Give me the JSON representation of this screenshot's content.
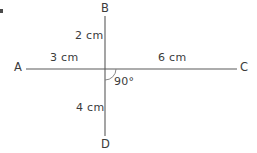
{
  "figure": {
    "background_color": "#ffffff",
    "stroke_color": "#5a5a5a",
    "text_color": "#3b3b3b",
    "vertices": [
      {
        "id": "A",
        "label": "A",
        "x": 14,
        "y": 62
      },
      {
        "id": "B",
        "label": "B",
        "x": 101,
        "y": 3
      },
      {
        "id": "C",
        "label": "C",
        "x": 240,
        "y": 62
      },
      {
        "id": "D",
        "label": "D",
        "x": 101,
        "y": 139
      }
    ],
    "segments": [
      {
        "id": "AC",
        "from": "A",
        "to": "C",
        "x1": 26,
        "y1": 69,
        "x2": 237,
        "y2": 69
      },
      {
        "id": "BD",
        "from": "B",
        "to": "D",
        "x1": 105,
        "y1": 16,
        "x2": 105,
        "y2": 136
      }
    ],
    "intersection": {
      "x": 105,
      "y": 69
    },
    "measurements": [
      {
        "id": "OB",
        "label": "2 cm",
        "value": 2,
        "unit": "cm",
        "x": 75,
        "y": 30
      },
      {
        "id": "AO",
        "label": "3 cm",
        "value": 3,
        "unit": "cm",
        "x": 50,
        "y": 52
      },
      {
        "id": "OC",
        "label": "6 cm",
        "value": 6,
        "unit": "cm",
        "x": 158,
        "y": 52
      },
      {
        "id": "OD",
        "label": "4 cm",
        "value": 4,
        "unit": "cm",
        "x": 76,
        "y": 102
      }
    ],
    "angle": {
      "label": "90°",
      "value": 90,
      "unit": "degrees",
      "label_x": 114,
      "label_y": 76,
      "arc_radius": 11
    }
  }
}
